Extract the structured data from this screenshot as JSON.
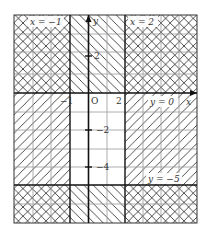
{
  "diagram": {
    "type": "region-shading-graph",
    "axes": {
      "x_label": "x",
      "y_label": "y",
      "origin_label": "O",
      "x_ticks": [
        {
          "value": -1,
          "label": "−1"
        },
        {
          "value": 2,
          "label": "2"
        }
      ],
      "y_ticks": [
        {
          "value": 2,
          "label": "2"
        },
        {
          "value": -2,
          "label": "−2"
        },
        {
          "value": -4,
          "label": "−4"
        }
      ],
      "x_range": [
        -4,
        6
      ],
      "y_range": [
        -7,
        4
      ]
    },
    "boundary_lines": [
      {
        "id": "x_neg1",
        "label": "x = −1",
        "orientation": "vertical",
        "value": -1
      },
      {
        "id": "x_2",
        "label": "x = 2",
        "orientation": "vertical",
        "value": 2
      },
      {
        "id": "y_0",
        "label": "y = 0",
        "orientation": "horizontal",
        "value": 0
      },
      {
        "id": "y_neg5",
        "label": "y = −5",
        "orientation": "horizontal",
        "value": -5
      }
    ],
    "shading": {
      "backslash_hatch": "y ≥ 0 or y ≤ −5",
      "slash_hatch": "x ≤ −1 or x ≥ 2",
      "unshaded_region": "−1 < x < 2 and −5 < y < 0"
    },
    "colors": {
      "grid": "#999999",
      "axis": "#111111",
      "hatch": "#222222",
      "label_bg": "#ffffff"
    }
  }
}
